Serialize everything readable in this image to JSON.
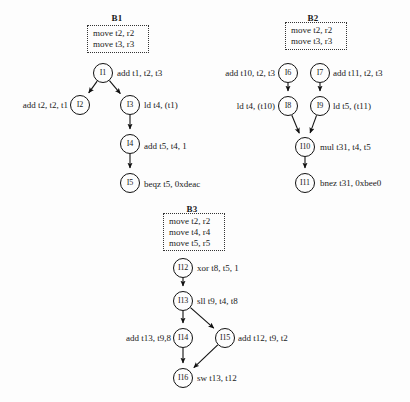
{
  "figure": {
    "type": "dependence-graphs",
    "background": "#fdfdfd",
    "ink": "#1a1a1a"
  },
  "blocks": [
    {
      "id": "b1",
      "title": "B1",
      "title_x": 117,
      "title_y": 13,
      "prologue": {
        "x": 87,
        "y": 25,
        "w": 62,
        "h": 28,
        "lines": [
          "move t2, r2",
          "move t3, r3"
        ]
      },
      "nodes": [
        {
          "id": "i1",
          "label": "I1",
          "x": 103,
          "y": 73,
          "instr": "add t1, t2, t3",
          "side": "right",
          "tx": 117,
          "ty": 73
        },
        {
          "id": "i2",
          "label": "I2",
          "x": 80,
          "y": 105,
          "instr": "add t2, t2, t1",
          "side": "left",
          "tx": 68,
          "ty": 105
        },
        {
          "id": "i3",
          "label": "I3",
          "x": 130,
          "y": 105,
          "instr": "ld t4, (t1)",
          "side": "right",
          "tx": 144,
          "ty": 105
        },
        {
          "id": "i4",
          "label": "I4",
          "x": 130,
          "y": 144,
          "instr": "add t5, t4, 1",
          "side": "right",
          "tx": 144,
          "ty": 146
        },
        {
          "id": "i5",
          "label": "I5",
          "x": 130,
          "y": 183,
          "instr": "beqz t5, 0xdeac",
          "side": "right",
          "tx": 144,
          "ty": 184
        }
      ],
      "edges": [
        {
          "from": "i1",
          "to": "i2"
        },
        {
          "from": "i1",
          "to": "i3"
        },
        {
          "from": "i3",
          "to": "i4"
        },
        {
          "from": "i4",
          "to": "i5"
        }
      ]
    },
    {
      "id": "b2",
      "title": "B2",
      "title_x": 313,
      "title_y": 13,
      "prologue": {
        "x": 285,
        "y": 22,
        "w": 62,
        "h": 28,
        "lines": [
          "move t2, r2",
          "move t3, r3"
        ]
      },
      "nodes": [
        {
          "id": "i6",
          "label": "I6",
          "x": 288,
          "y": 73,
          "instr": "add t10, t2, t3",
          "side": "left",
          "tx": 275,
          "ty": 73
        },
        {
          "id": "i7",
          "label": "I7",
          "x": 320,
          "y": 73,
          "instr": "add t11, t2, t3",
          "side": "right",
          "tx": 333,
          "ty": 73
        },
        {
          "id": "i8",
          "label": "I8",
          "x": 288,
          "y": 106,
          "instr": "ld t4, (t10)",
          "side": "left",
          "tx": 275,
          "ty": 106
        },
        {
          "id": "i9",
          "label": "I9",
          "x": 320,
          "y": 106,
          "instr": "ld t5, (t11)",
          "side": "right",
          "tx": 333,
          "ty": 106
        },
        {
          "id": "i10",
          "label": "I10",
          "x": 305,
          "y": 147,
          "instr": "mul t31, t4, t5",
          "side": "right",
          "tx": 320,
          "ty": 147
        },
        {
          "id": "i11",
          "label": "I11",
          "x": 305,
          "y": 183,
          "instr": "bnez t31, 0xbee0",
          "side": "right",
          "tx": 320,
          "ty": 183
        }
      ],
      "edges": [
        {
          "from": "i6",
          "to": "i8"
        },
        {
          "from": "i7",
          "to": "i9"
        },
        {
          "from": "i8",
          "to": "i10"
        },
        {
          "from": "i9",
          "to": "i10"
        },
        {
          "from": "i10",
          "to": "i11"
        }
      ]
    },
    {
      "id": "b3",
      "title": "B3",
      "title_x": 192,
      "title_y": 204,
      "prologue": {
        "x": 163,
        "y": 213,
        "w": 62,
        "h": 38,
        "lines": [
          "move t2, r2",
          "move t4, r4",
          "move t5, r5"
        ]
      },
      "nodes": [
        {
          "id": "i12",
          "label": "I12",
          "x": 183,
          "y": 268,
          "instr": "xor t8, t5, 1",
          "side": "right",
          "tx": 197,
          "ty": 268
        },
        {
          "id": "i13",
          "label": "I13",
          "x": 183,
          "y": 301,
          "instr": "sll t9, t4, t8",
          "side": "right",
          "tx": 197,
          "ty": 301
        },
        {
          "id": "i14",
          "label": "I14",
          "x": 183,
          "y": 338,
          "instr": "add t13, t9,8",
          "side": "left",
          "tx": 171,
          "ty": 338
        },
        {
          "id": "i15",
          "label": "I15",
          "x": 225,
          "y": 338,
          "instr": "add t12, t9, t2",
          "side": "right",
          "tx": 238,
          "ty": 338
        },
        {
          "id": "i16",
          "label": "I16",
          "x": 183,
          "y": 378,
          "instr": "sw t13, t12",
          "side": "right",
          "tx": 197,
          "ty": 378
        }
      ],
      "edges": [
        {
          "from": "i12",
          "to": "i13"
        },
        {
          "from": "i13",
          "to": "i14"
        },
        {
          "from": "i13",
          "to": "i15"
        },
        {
          "from": "i14",
          "to": "i16"
        },
        {
          "from": "i15",
          "to": "i16"
        }
      ]
    }
  ]
}
